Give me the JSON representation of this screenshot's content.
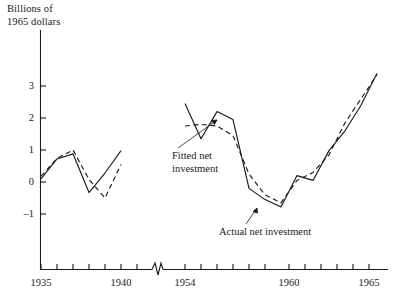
{
  "chart_data": {
    "type": "line",
    "title": "Billions of\n1965 dollars",
    "ylabel": "Billions of 1965 dollars",
    "xlabel": "",
    "grid": false,
    "legend": "inline-annotations",
    "ylim": [
      -1.6,
      3.6
    ],
    "yticks": [
      -1,
      0,
      1,
      2,
      3
    ],
    "ytick_labels": [
      "–1",
      "0",
      "1",
      "2",
      "3"
    ],
    "axis_break": true,
    "axis_break_note": "x-axis broken between 1941 and 1954",
    "xtick_labels": [
      "1935",
      "1940",
      "1954",
      "1960",
      "1965"
    ],
    "xticks": [
      1935,
      1936,
      1937,
      1938,
      1939,
      1940,
      1941,
      1954,
      1955,
      1956,
      1957,
      1958,
      1959,
      1960,
      1961,
      1962,
      1963,
      1964,
      1965,
      1966
    ],
    "segments": [
      {
        "name": "prewar",
        "x": [
          1935,
          1936,
          1937,
          1938,
          1939,
          1940
        ],
        "series": [
          {
            "name": "Actual net investment",
            "style": "solid",
            "values": [
              0.1,
              0.72,
              0.88,
              -0.33,
              0.28,
              0.98
            ]
          },
          {
            "name": "Fitted net investment",
            "style": "dashed",
            "values": [
              0.18,
              0.74,
              1.0,
              0.08,
              -0.5,
              0.55
            ]
          }
        ]
      },
      {
        "name": "postwar",
        "x": [
          1954,
          1955,
          1956,
          1957,
          1958,
          1959,
          1960,
          1961,
          1962,
          1963,
          1964,
          1965,
          1966
        ],
        "series": [
          {
            "name": "Actual net investment",
            "style": "solid",
            "values": [
              2.45,
              1.35,
              2.2,
              1.95,
              -0.2,
              -0.55,
              -0.78,
              0.2,
              0.05,
              0.98,
              1.6,
              2.4,
              3.4
            ]
          },
          {
            "name": "Fitted net investment",
            "style": "dashed",
            "values": [
              1.75,
              1.8,
              1.75,
              1.45,
              0.25,
              -0.4,
              -0.65,
              0.05,
              0.3,
              0.85,
              1.85,
              2.6,
              3.35
            ]
          }
        ]
      }
    ],
    "annotations": [
      {
        "label": "Fitted net\ninvestment",
        "points_to_series": "Fitted net investment"
      },
      {
        "label": "Actual net investment",
        "points_to_series": "Actual net investment"
      }
    ],
    "colors": {
      "axis": "#1a1a1a",
      "actual": "#1a1a1a",
      "fitted": "#1a1a1a",
      "background": "#ffffff"
    }
  },
  "axis": {
    "title": "Billions of\n1965 dollars",
    "ytick_3": "3",
    "ytick_2": "2",
    "ytick_1": "1",
    "ytick_0": "0",
    "ytick_m1": "–1",
    "xtick_1935": "1935",
    "xtick_1940": "1940",
    "xtick_1954": "1954",
    "xtick_1960": "1960",
    "xtick_1965": "1965"
  },
  "annotations": {
    "fitted": "Fitted net\ninvestment",
    "actual": "Actual net investment"
  }
}
